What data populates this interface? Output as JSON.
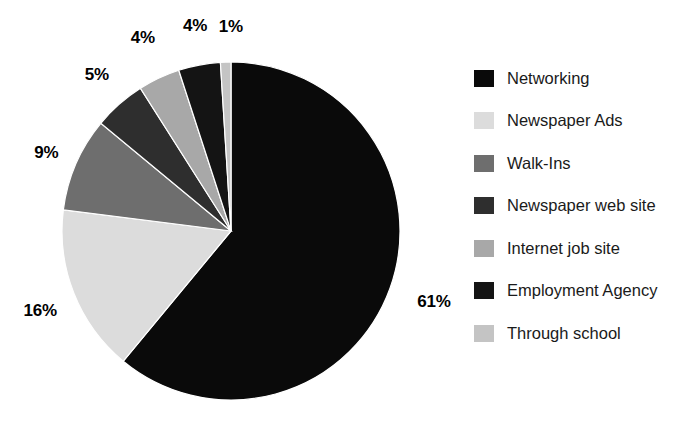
{
  "chart_data": {
    "type": "pie",
    "title": "",
    "subtitle": "",
    "xlabel": "",
    "ylabel": "",
    "grid": false,
    "legend_position": "right",
    "start_angle_deg": 0,
    "direction": "clockwise",
    "categories": [
      "Networking",
      "Newspaper Ads",
      "Walk-Ins",
      "Newspaper web site",
      "Internet job site",
      "Employment Agency",
      "Through school"
    ],
    "values": [
      61,
      16,
      9,
      5,
      4,
      4,
      1
    ],
    "value_labels": [
      "61%",
      "16%",
      "9%",
      "5%",
      "4%",
      "4%",
      "1%"
    ],
    "colors": [
      "#0a0a0a",
      "#dcdcdc",
      "#6e6e6e",
      "#2e2e2e",
      "#a8a8a8",
      "#141414",
      "#c4c4c4"
    ],
    "slices": [
      {
        "label": "Networking",
        "value": 61,
        "value_label": "61%",
        "color": "#0a0a0a"
      },
      {
        "label": "Newspaper Ads",
        "value": 16,
        "value_label": "16%",
        "color": "#dcdcdc"
      },
      {
        "label": "Walk-Ins",
        "value": 9,
        "value_label": "9%",
        "color": "#6e6e6e"
      },
      {
        "label": "Newspaper web site",
        "value": 5,
        "value_label": "5%",
        "color": "#2e2e2e"
      },
      {
        "label": "Internet job site",
        "value": 4,
        "value_label": "4%",
        "color": "#a8a8a8"
      },
      {
        "label": "Employment Agency",
        "value": 4,
        "value_label": "4%",
        "color": "#141414"
      },
      {
        "label": "Through school",
        "value": 1,
        "value_label": "1%",
        "color": "#c4c4c4"
      }
    ]
  },
  "legend": {
    "items": [
      {
        "label": "Networking",
        "swatch_color": "#0a0a0a"
      },
      {
        "label": "Newspaper Ads",
        "swatch_color": "#dcdcdc"
      },
      {
        "label": "Walk-Ins",
        "swatch_color": "#6e6e6e"
      },
      {
        "label": "Newspaper web site",
        "swatch_color": "#2e2e2e"
      },
      {
        "label": "Internet job site",
        "swatch_color": "#a8a8a8"
      },
      {
        "label": "Employment Agency",
        "swatch_color": "#141414"
      },
      {
        "label": "Through school",
        "swatch_color": "#c4c4c4"
      }
    ]
  },
  "pie_geometry": {
    "center_x": 231,
    "center_y": 231,
    "radius": 169
  }
}
